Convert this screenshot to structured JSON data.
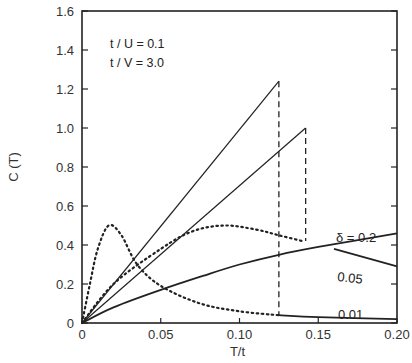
{
  "chart_data": {
    "type": "line",
    "title": "",
    "xlabel": "T/t",
    "ylabel": "C (T)",
    "xlim": [
      0,
      0.2
    ],
    "ylim": [
      0,
      1.6
    ],
    "x_ticks": [
      "0",
      "0.05",
      "0.10",
      "0.15",
      "0.20"
    ],
    "y_ticks": [
      "0",
      "0.2",
      "0.4",
      "0.6",
      "0.8",
      "1.0",
      "1.2",
      "1.4",
      "1.6"
    ],
    "grid": false,
    "annotations": [
      "t / U = 0.1",
      "t / V = 3.0"
    ],
    "series": [
      {
        "name": "δ = 0.2",
        "style": "solid-thick",
        "x": [
          0,
          0.02,
          0.05,
          0.08,
          0.1,
          0.125,
          0.15,
          0.2
        ],
        "y": [
          0,
          0.08,
          0.17,
          0.25,
          0.3,
          0.35,
          0.39,
          0.46
        ]
      },
      {
        "name": "0.05",
        "style": "dotted-then-solid",
        "x": [
          0,
          0.02,
          0.05,
          0.07,
          0.09,
          0.11,
          0.125,
          0.14,
          0.16,
          0.2
        ],
        "y": [
          0,
          0.2,
          0.38,
          0.47,
          0.5,
          0.48,
          0.45,
          0.42,
          0.38,
          0.29
        ]
      },
      {
        "name": "0.01",
        "style": "dotted-then-solid",
        "x": [
          0,
          0.005,
          0.01,
          0.017,
          0.025,
          0.035,
          0.05,
          0.075,
          0.1,
          0.125,
          0.15,
          0.2
        ],
        "y": [
          0,
          0.2,
          0.38,
          0.5,
          0.45,
          0.3,
          0.19,
          0.1,
          0.06,
          0.04,
          0.03,
          0.02
        ]
      },
      {
        "name": "upper linear (ends 0.125)",
        "style": "solid-thin",
        "x": [
          0,
          0.125
        ],
        "y": [
          0,
          1.24
        ]
      },
      {
        "name": "lower linear (ends 0.142)",
        "style": "solid-thin",
        "x": [
          0,
          0.142
        ],
        "y": [
          0,
          1.0
        ]
      }
    ],
    "dashed_drops": [
      {
        "x": 0.125,
        "from": 1.24,
        "to": 0.04
      },
      {
        "x": 0.142,
        "from": 1.0,
        "to": 0.42
      }
    ],
    "curve_labels": [
      "δ = 0.2",
      "0.05",
      "0.01"
    ]
  }
}
